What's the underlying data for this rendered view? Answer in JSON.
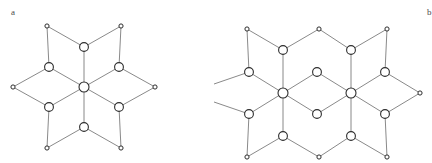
{
  "figure": {
    "background_color": "#ffffff",
    "width": 431,
    "height": 163,
    "edge_color": "#6b6b6b",
    "node_stroke_color": "#2d2d2d",
    "node_fill_color": "#ffffff",
    "label_color": "#4a4a4a"
  },
  "panels": {
    "a": {
      "label": "a"
    },
    "b": {
      "label": "b"
    }
  },
  "chart_data": {
    "type": "diagram",
    "subtype": "node-link-graph",
    "title": "",
    "panel_count": 2,
    "panel_labels": [
      "a",
      "b"
    ],
    "node_kinds": [
      {
        "name": "hub",
        "radius": 5.0,
        "description": "large interior vertex, degree 6"
      },
      {
        "name": "interior",
        "radius": 4.2,
        "description": "large vertex, degree 3"
      },
      {
        "name": "boundary",
        "radius": 2.1,
        "description": "small terminal vertex, degree 2"
      }
    ],
    "panels": [
      {
        "label": "a",
        "node_count": 13,
        "edge_count": 18,
        "nodes": [
          {
            "id": "a0",
            "x": 84,
            "y": 87,
            "kind": "hub",
            "r": 5.0
          },
          {
            "id": "a1",
            "x": 84,
            "y": 47,
            "kind": "interior",
            "r": 4.4
          },
          {
            "id": "a2",
            "x": 84,
            "y": 127,
            "kind": "interior",
            "r": 4.4
          },
          {
            "id": "a3",
            "x": 49,
            "y": 67,
            "kind": "interior",
            "r": 4.4
          },
          {
            "id": "a4",
            "x": 119,
            "y": 67,
            "kind": "interior",
            "r": 4.4
          },
          {
            "id": "a5",
            "x": 49,
            "y": 107,
            "kind": "interior",
            "r": 4.4
          },
          {
            "id": "a6",
            "x": 119,
            "y": 107,
            "kind": "interior",
            "r": 4.4
          },
          {
            "id": "a7",
            "x": 47,
            "y": 26,
            "kind": "boundary",
            "r": 2.1
          },
          {
            "id": "a8",
            "x": 121,
            "y": 26,
            "kind": "boundary",
            "r": 2.1
          },
          {
            "id": "a9",
            "x": 13,
            "y": 87,
            "kind": "boundary",
            "r": 2.1
          },
          {
            "id": "a10",
            "x": 155,
            "y": 87,
            "kind": "boundary",
            "r": 2.1
          },
          {
            "id": "a11",
            "x": 47,
            "y": 148,
            "kind": "boundary",
            "r": 2.1
          },
          {
            "id": "a12",
            "x": 121,
            "y": 148,
            "kind": "boundary",
            "r": 2.1
          }
        ],
        "edges": [
          [
            "a0",
            "a1"
          ],
          [
            "a0",
            "a2"
          ],
          [
            "a0",
            "a3"
          ],
          [
            "a0",
            "a4"
          ],
          [
            "a0",
            "a5"
          ],
          [
            "a0",
            "a6"
          ],
          [
            "a1",
            "a7"
          ],
          [
            "a1",
            "a8"
          ],
          [
            "a2",
            "a11"
          ],
          [
            "a2",
            "a12"
          ],
          [
            "a3",
            "a7"
          ],
          [
            "a3",
            "a9"
          ],
          [
            "a4",
            "a8"
          ],
          [
            "a4",
            "a10"
          ],
          [
            "a5",
            "a9"
          ],
          [
            "a5",
            "a11"
          ],
          [
            "a6",
            "a10"
          ],
          [
            "a6",
            "a12"
          ]
        ]
      },
      {
        "label": "b",
        "node_count": 22,
        "edge_count": 31,
        "nodes": [
          {
            "id": "b0",
            "x": 283,
            "y": 93,
            "kind": "hub",
            "r": 5.0
          },
          {
            "id": "b1",
            "x": 351,
            "y": 93,
            "kind": "hub",
            "r": 5.0
          },
          {
            "id": "b2",
            "x": 283,
            "y": 50,
            "kind": "interior",
            "r": 4.4
          },
          {
            "id": "b3",
            "x": 351,
            "y": 50,
            "kind": "interior",
            "r": 4.4
          },
          {
            "id": "b4",
            "x": 283,
            "y": 136,
            "kind": "interior",
            "r": 4.4
          },
          {
            "id": "b5",
            "x": 351,
            "y": 136,
            "kind": "interior",
            "r": 4.4
          },
          {
            "id": "b6",
            "x": 249,
            "y": 72,
            "kind": "interior",
            "r": 4.4
          },
          {
            "id": "b7",
            "x": 317,
            "y": 72,
            "kind": "interior",
            "r": 4.4
          },
          {
            "id": "b8",
            "x": 385,
            "y": 72,
            "kind": "interior",
            "r": 4.4
          },
          {
            "id": "b9",
            "x": 249,
            "y": 114,
            "kind": "interior",
            "r": 4.4
          },
          {
            "id": "b10",
            "x": 317,
            "y": 114,
            "kind": "interior",
            "r": 4.4
          },
          {
            "id": "b11",
            "x": 385,
            "y": 114,
            "kind": "interior",
            "r": 4.4
          },
          {
            "id": "b12",
            "x": 247,
            "y": 29,
            "kind": "boundary",
            "r": 2.1
          },
          {
            "id": "b13",
            "x": 319,
            "y": 29,
            "kind": "boundary",
            "r": 2.1
          },
          {
            "id": "b14",
            "x": 387,
            "y": 29,
            "kind": "boundary",
            "r": 2.1
          },
          {
            "id": "b15",
            "x": 247,
            "y": 157,
            "kind": "boundary",
            "r": 2.1
          },
          {
            "id": "b16",
            "x": 319,
            "y": 157,
            "kind": "boundary",
            "r": 2.1
          },
          {
            "id": "b17",
            "x": 387,
            "y": 157,
            "kind": "boundary",
            "r": 2.1
          },
          {
            "id": "b18",
            "x": 420,
            "y": 93,
            "kind": "boundary",
            "r": 2.1
          },
          {
            "id": "b19",
            "x": 214,
            "y": 84,
            "kind": "clipped",
            "r": 0
          },
          {
            "id": "b20",
            "x": 214,
            "y": 102,
            "kind": "clipped",
            "r": 0
          }
        ],
        "edges": [
          [
            "b0",
            "b2"
          ],
          [
            "b0",
            "b4"
          ],
          [
            "b0",
            "b6"
          ],
          [
            "b0",
            "b7"
          ],
          [
            "b0",
            "b9"
          ],
          [
            "b0",
            "b10"
          ],
          [
            "b1",
            "b3"
          ],
          [
            "b1",
            "b5"
          ],
          [
            "b1",
            "b7"
          ],
          [
            "b1",
            "b8"
          ],
          [
            "b1",
            "b10"
          ],
          [
            "b1",
            "b11"
          ],
          [
            "b2",
            "b12"
          ],
          [
            "b2",
            "b13"
          ],
          [
            "b3",
            "b13"
          ],
          [
            "b3",
            "b14"
          ],
          [
            "b4",
            "b15"
          ],
          [
            "b4",
            "b16"
          ],
          [
            "b5",
            "b16"
          ],
          [
            "b5",
            "b17"
          ],
          [
            "b6",
            "b12"
          ],
          [
            "b6",
            "b19"
          ],
          [
            "b8",
            "b14"
          ],
          [
            "b8",
            "b18"
          ],
          [
            "b9",
            "b15"
          ],
          [
            "b9",
            "b20"
          ],
          [
            "b11",
            "b17"
          ],
          [
            "b11",
            "b18"
          ]
        ]
      }
    ]
  }
}
